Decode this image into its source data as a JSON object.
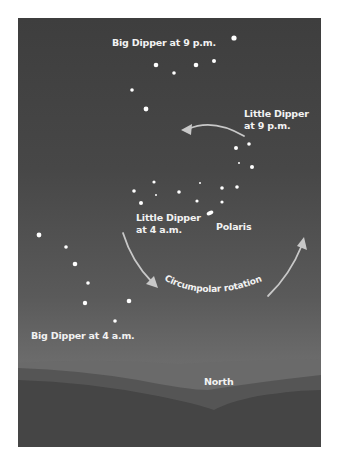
{
  "figure": {
    "labels": {
      "big_dipper_9pm": "Big Dipper at 9 p.m.",
      "little_dipper_9pm_line1": "Little Dipper",
      "little_dipper_9pm_line2": "at 9 p.m.",
      "little_dipper_4am_line1": "Little Dipper",
      "little_dipper_4am_line2": "at 4 a.m.",
      "polaris": "Polaris",
      "circumpolar_rotation": "Circumpolar rotation",
      "big_dipper_4am": "Big Dipper at 4 a.m.",
      "north": "North"
    },
    "colors": {
      "sky_top": "#3e3e3e",
      "sky_bottom": "#7d7d7d",
      "text": "#f2f2f2",
      "arrow": "#c8c8c8",
      "hill_far": "#6a6a6a",
      "hill_mid": "#555555",
      "hill_near": "#454545"
    }
  }
}
